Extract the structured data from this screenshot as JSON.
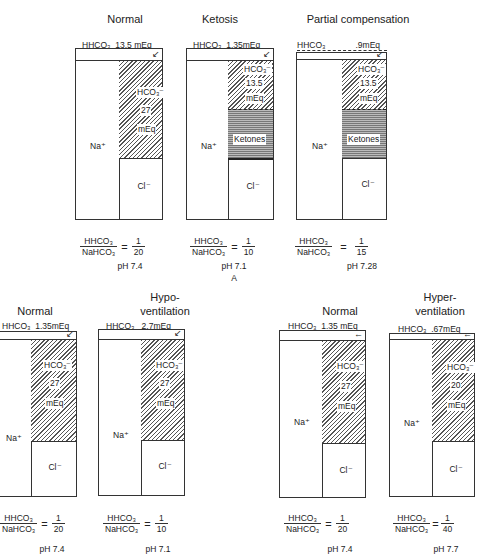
{
  "panels": [
    {
      "id": "top-normal",
      "title": "Normal",
      "hhco3": "HHCO₃",
      "hhco3_value": "13.5 mEq",
      "na": "Na⁺",
      "hco3": "HCO₃⁻",
      "hco3_value": "27",
      "hco3_unit": "mEq",
      "cl": "Cl⁻",
      "ratio_num": "HHCO₃",
      "ratio_den": "NaHCO₃",
      "ratio_value_num": "1",
      "ratio_value_den": "20",
      "ph": "pH 7.4"
    },
    {
      "id": "top-ketosis",
      "title": "Ketosis",
      "hhco3": "HHCO₃",
      "hhco3_value": "1.35mEq",
      "na": "Na⁺",
      "hco3": "HCO₃⁻",
      "hco3_value": "13.5",
      "hco3_unit": "mEq",
      "ketones": "Ketones",
      "cl": "Cl⁻",
      "ratio_num": "HHCO₃",
      "ratio_den": "NaHCO₃",
      "ratio_value_num": "1",
      "ratio_value_den": "10",
      "ph": "pH 7.1",
      "sublabel": "A"
    },
    {
      "id": "top-partial",
      "title": "Partial compensation",
      "hhco3": "HHCO₃",
      "hhco3_value": ".9mEq",
      "na": "Na⁺",
      "hco3": "HCO₃⁻",
      "hco3_value": "13.5",
      "hco3_unit": "mEq",
      "ketones": "Ketones",
      "cl": "Cl⁻",
      "ratio_num": "HHCO₃",
      "ratio_den": "NaHCO₃",
      "ratio_value_num": "1",
      "ratio_value_den": "15",
      "ph": "pH 7.28"
    },
    {
      "id": "bottom-left-normal",
      "title": "Normal",
      "hhco3": "HHCO₃",
      "hhco3_value": "1.35mEq",
      "na": "Na⁺",
      "hco3": "HCO₃⁻",
      "hco3_value": "27",
      "hco3_unit": "mEq",
      "cl": "Cl⁻",
      "ratio_num": "HHCO₃",
      "ratio_den": "NaHCO₃",
      "ratio_value_num": "1",
      "ratio_value_den": "20",
      "ph": "pH 7.4"
    },
    {
      "id": "bottom-hypoventilation",
      "title_line1": "Hypo-",
      "title_line2": "ventilation",
      "hhco3": "HHCO₃",
      "hhco3_value": "2.7mEq",
      "na": "Na⁺",
      "hco3": "HCO₃⁻",
      "hco3_value": "27",
      "hco3_unit": "mEq",
      "cl": "Cl⁻",
      "ratio_num": "HHCO₃",
      "ratio_den": "NaHCO₃",
      "ratio_value_num": "1",
      "ratio_value_den": "10",
      "ph": "pH 7.1"
    },
    {
      "id": "bottom-right-normal",
      "title": "Normal",
      "hhco3": "HHCO₃",
      "hhco3_value": "1.35 mEq",
      "na": "Na⁺",
      "hco3": "HCO₃⁻",
      "hco3_value": "27",
      "hco3_unit": "mEq",
      "cl": "Cl⁻",
      "ratio_num": "HHCO₃",
      "ratio_den": "NaHCO₃",
      "ratio_value_num": "1",
      "ratio_value_den": "20",
      "ph": "pH 7.4"
    },
    {
      "id": "bottom-hyperventilation",
      "title_line1": "Hyper-",
      "title_line2": "ventilation",
      "hhco3": "HHCO₃",
      "hhco3_value": ".67mEq",
      "na": "Na⁺",
      "hco3": "HCO₃⁻",
      "hco3_value": "20",
      "hco3_unit": "mEq",
      "cl": "Cl⁻",
      "ratio_num": "HHCO₃",
      "ratio_den": "NaHCO₃",
      "ratio_value_num": "1",
      "ratio_value_den": "40",
      "ph": "pH 7.7"
    }
  ]
}
